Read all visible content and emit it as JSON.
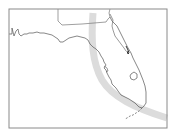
{
  "map": {
    "title": "Florida storm track map",
    "region": "Florida",
    "features": {
      "state_outline": "Florida",
      "neighbor_borders": [
        "Alabama",
        "Georgia"
      ],
      "lake": "Lake Okeechobee",
      "keys": "Florida Keys"
    },
    "track": {
      "label": "storm track swath",
      "color": "#dddddd"
    },
    "colors": {
      "background": "#ffffff",
      "frame": "#8a8a8a",
      "coastline": "#555555",
      "border": "#777777",
      "swath": "#dcdcdc"
    }
  }
}
